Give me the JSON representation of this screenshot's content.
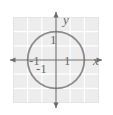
{
  "figure": {
    "kind": "coordinate-grid-with-unit-circle",
    "background_color": "#ffffff",
    "grid": {
      "fill_color": "#ededed",
      "line_color": "#ffffff",
      "border_color": "#e3e3e3",
      "cells_x": 6,
      "cells_y": 6,
      "x_range": [
        -3,
        3
      ],
      "y_range": [
        -3,
        3
      ],
      "grid_on": true
    },
    "axes": {
      "color": "#6b6b6b",
      "x_axis_label": "x",
      "y_axis_label": "y",
      "arrowheads": [
        "left",
        "right",
        "up",
        "down"
      ]
    },
    "curve": {
      "name": "unit-circle",
      "equation": "x^2 + y^2 = 1",
      "center": [
        0,
        0
      ],
      "radius": 1,
      "stroke_color": "#8c8c8c",
      "stroke_width": 1.8,
      "fill": "none"
    },
    "tick_labels": {
      "y_positive_one": "1",
      "x_negative_one": "-1",
      "x_positive_one": "1",
      "y_negative_one": "-1"
    }
  }
}
